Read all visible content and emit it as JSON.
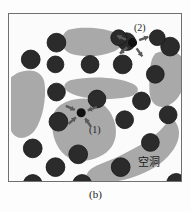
{
  "figure": {
    "caption": "(b)",
    "frame": {
      "x": 8,
      "y": 13,
      "width": 174,
      "height": 169,
      "border_color": "#6f6f6f",
      "background_color": "#fbfbfb"
    }
  },
  "colors": {
    "particle": "#2b2b2b",
    "particle_edge": "#141414",
    "void": "#a9a9a9",
    "background": "#fbfbfb",
    "arrow": "#5a5a5a",
    "node": "#111111",
    "text": "#1a1a1a"
  },
  "annotations": [
    {
      "id": "annotation-2",
      "label": "(2)",
      "label_x": 133,
      "label_y": 22,
      "node_x": 133,
      "node_y": 42,
      "node_r": 4.6,
      "arrow_direction": "outward",
      "arrow_count": 4,
      "description": "central node with four arrows radiating outward to neighbouring particles"
    },
    {
      "id": "annotation-1",
      "label": "(1)",
      "label_x": 88,
      "label_y": 124,
      "node_x": 81,
      "node_y": 113,
      "node_r": 4.6,
      "arrow_direction": "inward",
      "arrow_count": 4,
      "description": "central node with four arrows pointing inward toward the node inside a void"
    }
  ],
  "void_label": {
    "text": "空洞",
    "x": 137,
    "y": 156
  },
  "chart_data": {
    "type": "scatter",
    "title": "(b)",
    "xlabel": "",
    "ylabel": "",
    "annotations": [
      "(1)",
      "(2)",
      "空洞"
    ],
    "particles": [
      {
        "cx": 48,
        "cy": 29,
        "r": 9.5
      },
      {
        "cx": 22,
        "cy": 46,
        "r": 9.5
      },
      {
        "cx": 47,
        "cy": 51,
        "r": 8.5
      },
      {
        "cx": 82,
        "cy": 51,
        "r": 9.0
      },
      {
        "cx": 119,
        "cy": 28,
        "r": 9.0
      },
      {
        "cx": 163,
        "cy": 33,
        "r": 9.5
      },
      {
        "cx": 115,
        "cy": 51,
        "r": 9.5
      },
      {
        "cx": 148,
        "cy": 61,
        "r": 9.0
      },
      {
        "cx": 48,
        "cy": 79,
        "r": 9.0
      },
      {
        "cx": 89,
        "cy": 86,
        "r": 9.0
      },
      {
        "cx": 134,
        "cy": 88,
        "r": 9.0
      },
      {
        "cx": 50,
        "cy": 109,
        "r": 9.5
      },
      {
        "cx": 117,
        "cy": 107,
        "r": 9.0
      },
      {
        "cx": 161,
        "cy": 102,
        "r": 9.0
      },
      {
        "cx": 24,
        "cy": 136,
        "r": 9.5
      },
      {
        "cx": 70,
        "cy": 142,
        "r": 9.5
      },
      {
        "cx": 143,
        "cy": 130,
        "r": 9.0
      },
      {
        "cx": 47,
        "cy": 155,
        "r": 9.5
      },
      {
        "cx": 113,
        "cy": 155,
        "r": 9.5
      },
      {
        "cx": 24,
        "cy": 172,
        "r": 9.5
      },
      {
        "cx": 74,
        "cy": 172,
        "r": 9.5
      },
      {
        "cx": 169,
        "cy": 171,
        "r": 9.5
      },
      {
        "cx": 111,
        "cy": 24,
        "r": 8.0
      },
      {
        "cx": 150,
        "cy": 24,
        "r": 8.0
      }
    ],
    "voids": [
      "M 60 16 C 74 12 96 14 108 19 C 118 24 116 34 106 38 C 92 44 74 44 62 40 C 52 36 50 22 60 16 Z",
      "M 8 60 C 22 54 34 58 36 70 C 38 86 34 106 26 118 C 18 128 6 128 2 118 L 2 64 Z",
      "M 62 67 C 84 62 110 64 124 70 C 134 74 132 82 120 84 C 100 88 72 86 62 80 C 54 76 54 70 62 67 Z",
      "M 52 92 C 68 82 88 84 98 94 C 108 104 112 122 104 134 C 96 146 76 152 62 146 C 48 140 42 120 44 106 C 45 99 48 95 52 92 Z",
      "M 148 40 C 162 34 176 38 178 52 C 180 70 174 86 162 92 C 150 98 142 90 142 76 C 142 62 142 46 148 40 Z",
      "M 170 112 C 176 124 168 140 152 152 C 132 166 106 172 88 170 C 74 168 76 158 92 152 C 118 142 148 126 158 112 C 163 105 167 105 170 112 Z"
    ]
  }
}
